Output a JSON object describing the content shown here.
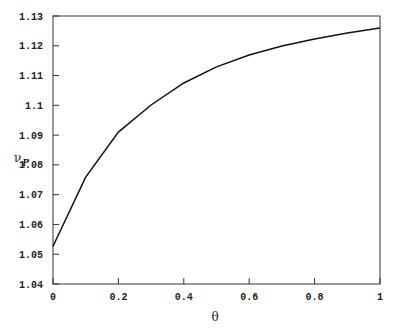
{
  "chart_data": {
    "type": "line",
    "title": "",
    "xlabel": "θ",
    "ylabel": "ν_P",
    "ylabel_main": "ν",
    "ylabel_sub": "P",
    "xlim": [
      0,
      1
    ],
    "ylim": [
      1.04,
      1.13
    ],
    "grid": false,
    "legend": null,
    "x_ticks": [
      "0",
      "0.2",
      "0.4",
      "0.6",
      "0.8",
      "1"
    ],
    "y_ticks": [
      "1.04",
      "1.05",
      "1.06",
      "1.07",
      "1.08",
      "1.09",
      "1.1",
      "1.11",
      "1.12",
      "1.13"
    ],
    "series": [
      {
        "name": "ν_P",
        "color": "#111111",
        "x": [
          0,
          0.1,
          0.2,
          0.3,
          0.4,
          0.5,
          0.6,
          0.7,
          0.8,
          0.9,
          1.0
        ],
        "values": [
          1.0527,
          1.0759,
          1.091,
          1.1001,
          1.1075,
          1.1129,
          1.1169,
          1.1199,
          1.1223,
          1.1243,
          1.126
        ]
      }
    ]
  }
}
